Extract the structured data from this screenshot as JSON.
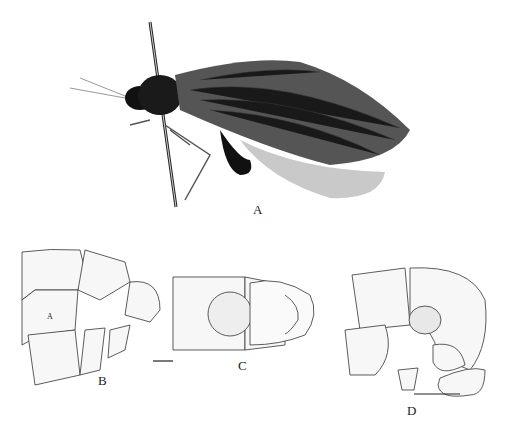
{
  "figure": {
    "panels": [
      {
        "id": "A",
        "label": "A",
        "kind": "photograph",
        "subject": "lacewing specimen, lateral view, pinned"
      },
      {
        "id": "B",
        "label": "B",
        "kind": "line-drawing",
        "subject": "terminal abdominal segments, lateral view",
        "inner_label": "A"
      },
      {
        "id": "C",
        "label": "C",
        "kind": "line-drawing",
        "subject": "terminal abdominal segments, ventral view"
      },
      {
        "id": "D",
        "label": "D",
        "kind": "line-drawing",
        "subject": "genitalia, lateral view"
      }
    ],
    "scale_bars": [
      "B-C",
      "D"
    ]
  }
}
